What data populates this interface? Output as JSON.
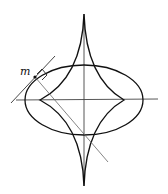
{
  "figure": {
    "label_m": "m",
    "colors": {
      "stroke": "#111111",
      "thin": "#555555",
      "background": "#ffffff"
    },
    "center": [
      84,
      100
    ],
    "ellipse": {
      "rx": 59,
      "ry": 35
    },
    "evolute_cusps": {
      "top": [
        84,
        14
      ],
      "bottom": [
        84,
        186
      ],
      "left": [
        40,
        100
      ],
      "right": [
        124,
        100
      ]
    }
  }
}
